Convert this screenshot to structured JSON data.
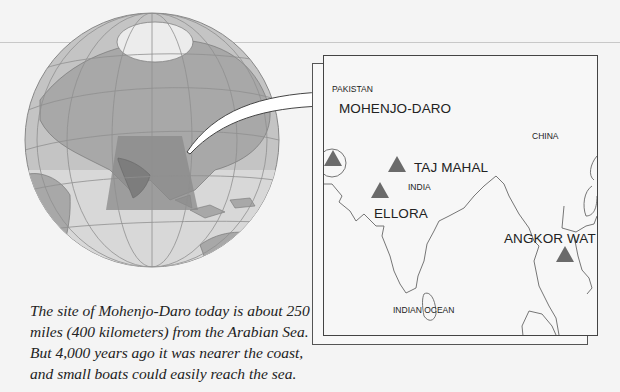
{
  "map": {
    "inset_labels": {
      "countries": [
        "PAKISTAN",
        "CHINA",
        "INDIA",
        "INDIAN OCEAN"
      ],
      "sites": [
        "MOHENJO-DARO",
        "TAJ MAHAL",
        "ELLORA",
        "ANGKOR WAT"
      ]
    },
    "highlight_color": "#8a8a8a",
    "land_color": "#a9a9a9",
    "marker_color": "#6b6b6b"
  },
  "labels": {
    "pakistan": "PAKISTAN",
    "china": "CHINA",
    "india": "INDIA",
    "indian_ocean": "INDIAN OCEAN",
    "mohenjo_daro": "MOHENJO-DARO",
    "taj_mahal": "TAJ MAHAL",
    "ellora": "ELLORA",
    "angkor_wat": "ANGKOR WAT"
  },
  "caption": {
    "line1": "The site of Mohenjo-Daro today is about 250",
    "line2": "miles (400 kilometers) from the Arabian Sea.",
    "line3": "But 4,000 years ago it was nearer the coast,",
    "line4": "and small boats could easily reach the sea."
  }
}
